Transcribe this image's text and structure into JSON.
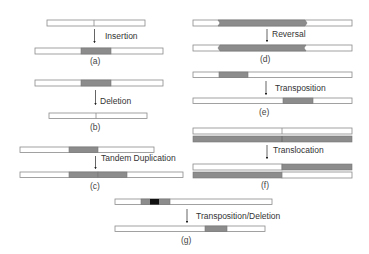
{
  "colors": {
    "segment": "#8c8c8c",
    "segment_dark": "#111111",
    "bar_fill": "#ffffff",
    "bar_stroke": "#8a8a8a",
    "arrow": "#222222",
    "text": "#333333"
  },
  "panels": [
    {
      "id": "a",
      "caption": "(a)",
      "operation": "Insertion"
    },
    {
      "id": "b",
      "caption": "(b)",
      "operation": "Deletion"
    },
    {
      "id": "c",
      "caption": "(c)",
      "operation": "Tandem Duplication"
    },
    {
      "id": "d",
      "caption": "(d)",
      "operation": "Reversal"
    },
    {
      "id": "e",
      "caption": "(e)",
      "operation": "Transposition"
    },
    {
      "id": "f",
      "caption": "(f)",
      "operation": "Translocation"
    },
    {
      "id": "g",
      "caption": "(g)",
      "operation": "Transposition/Deletion"
    }
  ]
}
